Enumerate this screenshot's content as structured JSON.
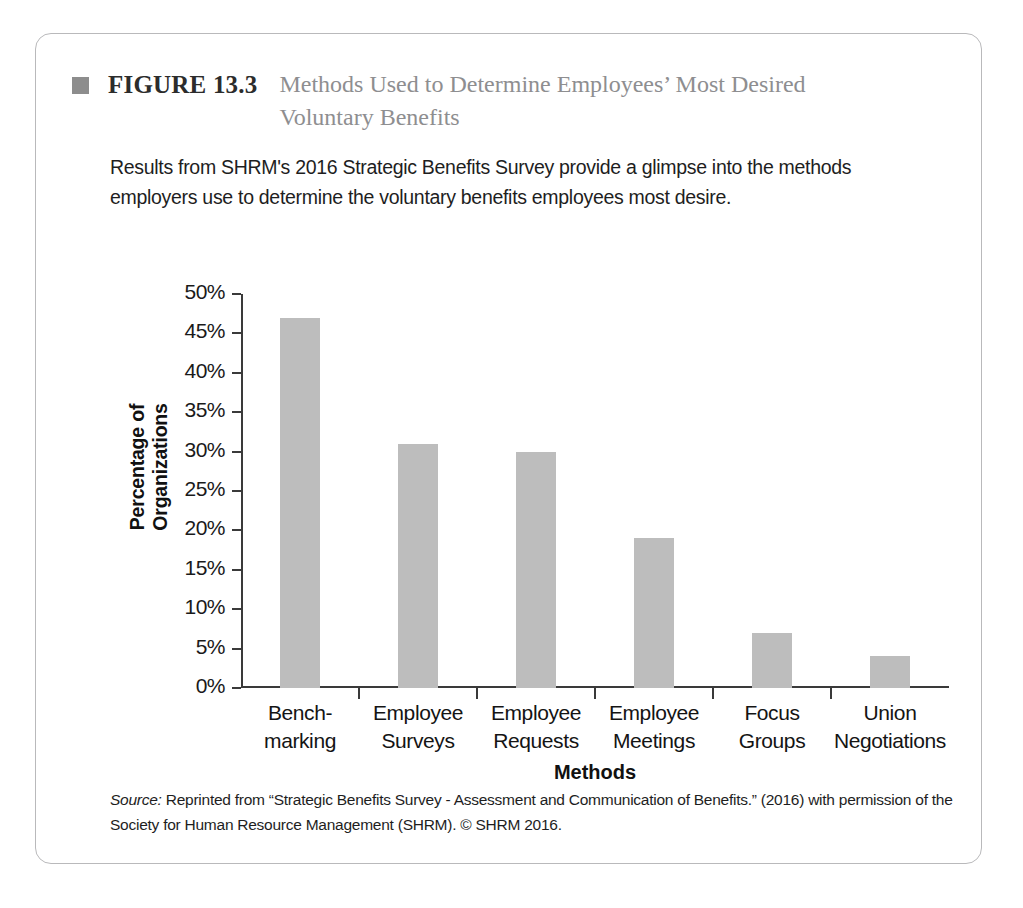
{
  "figure": {
    "marker_color": "#8d8d8d",
    "label": "FIGURE 13.3",
    "title": "Methods Used to Determine Employees’ Most Desired Voluntary Benefits",
    "intro": "Results from SHRM's 2016 Strategic Benefits Survey provide a glimpse into the methods employers use to determine the voluntary benefits employees most desire.",
    "source_word": "Source:",
    "source_text": " Reprinted from “Strategic Benefits Survey  - Assessment and Communication of Benefits.” (2016) with permission of the Society for Human Resource Management (SHRM). © SHRM 2016."
  },
  "chart_data": {
    "type": "bar",
    "title": "Methods Used to Determine Employees’ Most Desired Voluntary Benefits",
    "categories": [
      "Bench-\nmarking",
      "Employee\nSurveys",
      "Employee\nRequests",
      "Employee\nMeetings",
      "Focus\nGroups",
      "Union\nNegotiations"
    ],
    "values": [
      47,
      31,
      30,
      19,
      7,
      4
    ],
    "xlabel": "Methods",
    "ylabel": "Percentage of Organizations",
    "ylim": [
      0,
      50
    ],
    "ytick_labels": [
      "50%",
      "45%",
      "40%",
      "35%",
      "30%",
      "25%",
      "20%",
      "15%",
      "10%",
      "5%",
      "0%"
    ],
    "ytick_values": [
      50,
      45,
      40,
      35,
      30,
      25,
      20,
      15,
      10,
      5,
      0
    ],
    "grid": false,
    "legend": false,
    "bar_color": "#bdbdbd",
    "axis_color": "#3a3a3a"
  }
}
